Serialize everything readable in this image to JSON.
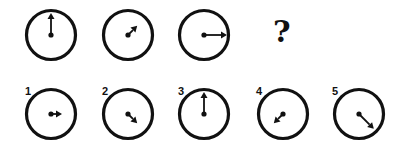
{
  "puzzle": {
    "question_mark": "?",
    "sequence": [
      {
        "id": "seq-1",
        "cx": 51,
        "cy": 35,
        "angle_deg": 0,
        "hand_length": 22
      },
      {
        "id": "seq-2",
        "cx": 128,
        "cy": 35,
        "angle_deg": 45,
        "hand_length": 13
      },
      {
        "id": "seq-3",
        "cx": 204,
        "cy": 35,
        "angle_deg": 90,
        "hand_length": 23
      }
    ],
    "options": [
      {
        "label": "1",
        "cx": 51,
        "cy": 114,
        "angle_deg": 90,
        "hand_length": 11,
        "short_start": 0
      },
      {
        "label": "2",
        "cx": 128,
        "cy": 114,
        "angle_deg": 135,
        "hand_length": 13
      },
      {
        "label": "3",
        "cx": 204,
        "cy": 114,
        "angle_deg": 0,
        "hand_length": 22
      },
      {
        "label": "4",
        "cx": 283,
        "cy": 114,
        "angle_deg": 225,
        "hand_length": 13
      },
      {
        "label": "5",
        "cx": 359,
        "cy": 114,
        "angle_deg": 135,
        "hand_length": 21
      }
    ],
    "colors": {
      "stroke": "#111111",
      "background": "#ffffff"
    }
  }
}
